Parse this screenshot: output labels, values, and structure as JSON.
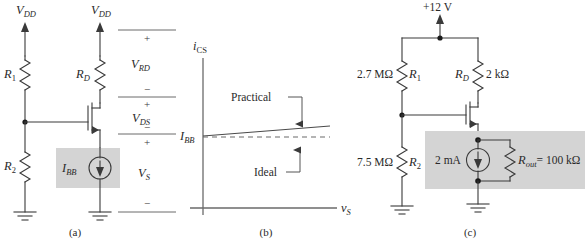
{
  "figure": {
    "panels": [
      {
        "id": "a",
        "caption": "(a)",
        "supply_left": "V_DD",
        "supply_right": "V_DD",
        "components": {
          "r1": "R1",
          "rd": "RD",
          "r2": "R2",
          "source": "IBB"
        },
        "voltage_labels": [
          "V_RD",
          "V_DS",
          "V_S"
        ],
        "polarity_plus": "+",
        "polarity_minus": "−"
      },
      {
        "id": "b",
        "caption": "(b)",
        "y_axis_label": "i_CS",
        "x_axis_label": "v_S",
        "origin_label": "I_BB",
        "annotations": [
          "Practical",
          "Ideal"
        ]
      },
      {
        "id": "c",
        "caption": "(c)",
        "supply": "+12 V",
        "r1_value": "2.7 MΩ",
        "r1_name": "R1",
        "r2_value": "7.5 MΩ",
        "r2_name": "R2",
        "rd_name": "RD",
        "rd_value": "2 kΩ",
        "current_value": "2 mA",
        "rout_label": "Rout = 100 kΩ"
      }
    ],
    "text": {
      "V": "V",
      "I": "I",
      "i": "i",
      "v": "v",
      "R": "R",
      "sub_DD": "DD",
      "sub_RD": "RD",
      "sub_DS": "DS",
      "sub_S": "S",
      "sub_BB": "BB",
      "sub_CS": "CS",
      "sub_1": "1",
      "sub_2": "2",
      "sub_D": "D",
      "sub_out": "out",
      "practical": "Practical",
      "ideal": "Ideal",
      "plus": "+",
      "minus": "−",
      "supply_12v": "+12 V",
      "val_2p7M": "2.7 MΩ",
      "val_7p5M": "7.5 MΩ",
      "val_2k": "2 kΩ",
      "val_2ma": "2 mA",
      "val_rout": "= 100 kΩ",
      "cap_a": "(a)",
      "cap_b": "(b)",
      "cap_c": "(c)"
    },
    "colors": {
      "wire": "#3a3a3a",
      "shade": "#d4d4d4",
      "text": "#2a2a2a",
      "background": "#ffffff"
    }
  }
}
